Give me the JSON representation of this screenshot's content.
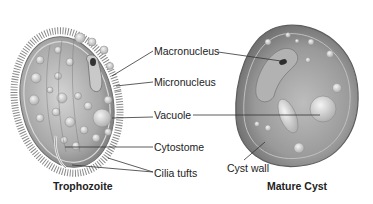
{
  "diagram": {
    "panels": [
      {
        "id": "trophozoite",
        "caption": "Trophozoite"
      },
      {
        "id": "mature-cyst",
        "caption": "Mature Cyst"
      }
    ],
    "labels": {
      "macronucleus": "Macronucleus",
      "micronucleus": "Micronucleus",
      "vacuole": "Vacuole",
      "cytostome": "Cytostome",
      "cilia_tufts": "Cilia tufts",
      "cyst_wall": "Cyst wall"
    },
    "colors": {
      "cell_fill": "#b8b8b8",
      "cell_dark": "#6e6e6e",
      "vacuole_fill": "#e2e2e2",
      "leader_line": "#333333",
      "text": "#222222"
    }
  }
}
